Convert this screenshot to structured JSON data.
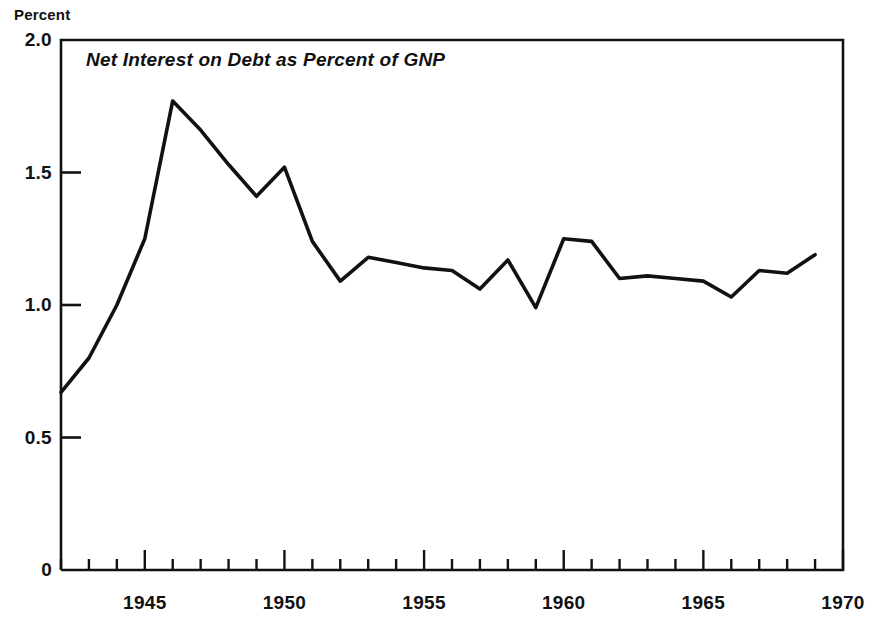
{
  "figure": {
    "axis_label_top": "Percent",
    "title": "Net Interest on Debt as Percent of GNP"
  },
  "chart_data": {
    "type": "line",
    "title": "Net Interest on Debt as Percent of GNP",
    "xlabel": "",
    "ylabel": "Percent",
    "xlim": [
      1942,
      1970
    ],
    "ylim": [
      0,
      2.0
    ],
    "grid": false,
    "legend": null,
    "line_color": "#111111",
    "x_ticks_major": [
      1945,
      1950,
      1955,
      1960,
      1965,
      1970
    ],
    "x_tick_labels": [
      "1945",
      "1950",
      "1955",
      "1960",
      "1965",
      "1970"
    ],
    "x_ticks_minor_step": 1,
    "y_ticks": [
      0,
      0.5,
      1.0,
      1.5,
      2.0
    ],
    "y_tick_labels": [
      "0",
      "0.5",
      "1.0",
      "1.5",
      "2.0"
    ],
    "x": [
      1942,
      1943,
      1944,
      1945,
      1946,
      1947,
      1948,
      1949,
      1950,
      1951,
      1952,
      1953,
      1954,
      1955,
      1956,
      1957,
      1958,
      1959,
      1960,
      1961,
      1962,
      1963,
      1964,
      1965,
      1966,
      1967,
      1968,
      1969
    ],
    "values": [
      0.67,
      0.8,
      1.0,
      1.25,
      1.77,
      1.66,
      1.53,
      1.41,
      1.52,
      1.24,
      1.09,
      1.18,
      1.16,
      1.14,
      1.13,
      1.06,
      1.17,
      0.99,
      1.25,
      1.24,
      1.1,
      1.11,
      1.1,
      1.09,
      1.03,
      1.13,
      1.12,
      1.19
    ],
    "series": [
      {
        "name": "Net interest on debt as percent of GNP",
        "values": [
          0.67,
          0.8,
          1.0,
          1.25,
          1.77,
          1.66,
          1.53,
          1.41,
          1.52,
          1.24,
          1.09,
          1.18,
          1.16,
          1.14,
          1.13,
          1.06,
          1.17,
          0.99,
          1.25,
          1.24,
          1.1,
          1.11,
          1.1,
          1.09,
          1.03,
          1.13,
          1.12,
          1.19
        ]
      }
    ],
    "annotations": []
  },
  "ytick_labels": [
    {
      "text": "2.0",
      "value": 2.0
    },
    {
      "text": "1.5",
      "value": 1.5
    },
    {
      "text": "1.0",
      "value": 1.0
    },
    {
      "text": "0.5",
      "value": 0.5
    },
    {
      "text": "0",
      "value": 0
    }
  ],
  "xtick_labels": [
    {
      "text": "1945",
      "value": 1945
    },
    {
      "text": "1950",
      "value": 1950
    },
    {
      "text": "1955",
      "value": 1955
    },
    {
      "text": "1960",
      "value": 1960
    },
    {
      "text": "1965",
      "value": 1965
    },
    {
      "text": "1970",
      "value": 1970
    }
  ]
}
